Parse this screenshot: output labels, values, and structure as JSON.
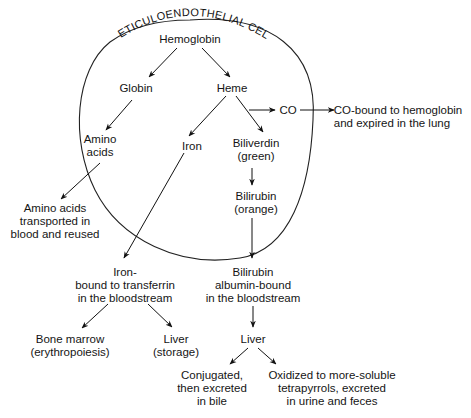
{
  "diagram": {
    "cell_label": "RETICULOENDOTHELIAL CELL",
    "nodes": {
      "hemoglobin": "Hemoglobin",
      "globin": "Globin",
      "heme": "Heme",
      "co": "CO",
      "co_fate": "CO-bound to hemoglobin\nand expired in the lung",
      "amino_acids": "Amino\nacids",
      "iron": "Iron",
      "biliverdin": "Biliverdin\n(green)",
      "bilirubin": "Bilirubin\n(orange)",
      "amino_fate": "Amino acids\ntransported in\nblood and reused",
      "iron_transferrin": "Iron-\nbound to transferrin\nin the bloodstream",
      "bilirubin_albumin": "Bilirubin\nalbumin-bound\nin the bloodstream",
      "bone_marrow": "Bone marrow\n(erythropoiesis)",
      "liver_storage": "Liver\n(storage)",
      "liver": "Liver",
      "conjugated": "Conjugated,\nthen excreted\nin bile",
      "oxidized": "Oxidized to more-soluble\ntetrapyrrols, excreted\nin urine and feces"
    },
    "edges": [
      [
        "hemoglobin",
        "globin"
      ],
      [
        "hemoglobin",
        "heme"
      ],
      [
        "globin",
        "amino_acids"
      ],
      [
        "heme",
        "iron"
      ],
      [
        "heme",
        "biliverdin"
      ],
      [
        "heme",
        "co"
      ],
      [
        "co",
        "co_fate"
      ],
      [
        "amino_acids",
        "amino_fate"
      ],
      [
        "biliverdin",
        "bilirubin"
      ],
      [
        "iron",
        "iron_transferrin"
      ],
      [
        "bilirubin",
        "bilirubin_albumin"
      ],
      [
        "iron_transferrin",
        "bone_marrow"
      ],
      [
        "iron_transferrin",
        "liver_storage"
      ],
      [
        "bilirubin_albumin",
        "liver"
      ],
      [
        "liver",
        "conjugated"
      ],
      [
        "liver",
        "oxidized"
      ]
    ]
  }
}
